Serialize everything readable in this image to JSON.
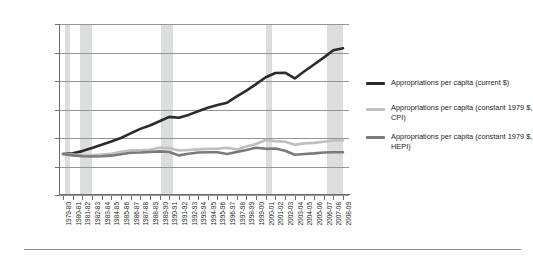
{
  "chart_data": {
    "type": "line",
    "title": "",
    "subtitle": "",
    "xlabel": "",
    "ylabel": "",
    "ylim": [
      0,
      60
    ],
    "ytick_labels": [
      "$0.00",
      "$10.00",
      "$20.00",
      "$30.00",
      "$40.00",
      "$50.00",
      "$60.00"
    ],
    "ytick_values": [
      0,
      10,
      20,
      30,
      40,
      50,
      60
    ],
    "grid": "horizontal",
    "legend_position": "right",
    "categories": [
      "1979-80",
      "1980-81",
      "1981-82",
      "1982-83",
      "1984-85",
      "1984-85",
      "1985-86",
      "1986-87",
      "1987-88",
      "1988-89",
      "1989-90",
      "1990-91",
      "1991-92",
      "1992-93",
      "1993-94",
      "1994-95",
      "1995-96",
      "1996-97",
      "1997-98",
      "1998-99",
      "1999-00",
      "2000-01",
      "2001-02",
      "2002-03",
      "2003-04",
      "2004-05",
      "2005-06",
      "2006-07",
      "2007-08",
      "2008-09"
    ],
    "x_tick_labels": [
      "1979-80",
      "1980-81",
      "1981-82",
      "1982-83",
      "1983-84",
      "1984-85",
      "1985-86",
      "1986-87",
      "1987-88",
      "1988-89",
      "1989-90",
      "1990-91",
      "1991-92",
      "1992-93",
      "1993-94",
      "1994-95",
      "1995-96",
      "1996-97",
      "1997-98",
      "1998-99",
      "1999-00",
      "2000-01",
      "2001-02",
      "2002-03",
      "2003-04",
      "2004-05",
      "2005-06",
      "2006-07",
      "2007-08",
      "2008-09"
    ],
    "series": [
      {
        "name": "Appropriations per capita (current $)",
        "color": "#2b2b2b",
        "width": 2.6,
        "values": [
          14.4,
          14.6,
          15.4,
          16.5,
          17.6,
          18.8,
          20.0,
          21.6,
          23.2,
          24.4,
          25.9,
          27.4,
          27.1,
          28.1,
          29.4,
          30.6,
          31.6,
          32.4,
          34.6,
          36.6,
          38.9,
          41.3,
          42.8,
          42.9,
          40.9,
          43.4,
          45.8,
          48.2,
          50.8,
          51.5
        ]
      },
      {
        "name": "Appropriations per capita (constant 1979 $, CPI)",
        "color": "#bfbfbf",
        "width": 2.6,
        "values": [
          14.4,
          14.2,
          14.0,
          13.9,
          14.2,
          14.5,
          15.2,
          15.7,
          15.7,
          15.9,
          16.6,
          16.5,
          15.6,
          15.8,
          16.0,
          16.2,
          16.2,
          16.6,
          16.0,
          17.0,
          17.9,
          19.3,
          18.9,
          18.7,
          17.6,
          18.1,
          18.3,
          18.7,
          19.1,
          19.1
        ]
      },
      {
        "name": "Appropriations per capita (constant 1979 $, HEPI)",
        "color": "#7a7a7a",
        "width": 2.6,
        "values": [
          14.4,
          13.9,
          13.6,
          13.5,
          13.6,
          13.8,
          14.3,
          14.8,
          14.9,
          15.1,
          15.3,
          15.1,
          13.9,
          14.5,
          14.9,
          15.0,
          15.0,
          14.4,
          15.1,
          15.8,
          16.6,
          16.2,
          16.3,
          15.5,
          14.1,
          14.4,
          14.6,
          14.9,
          15.0,
          15.0
        ]
      }
    ],
    "shaded_bands": [
      {
        "label": "recession",
        "start_index": 0.25,
        "end_index": 0.75,
        "color": "#d6d7d9"
      },
      {
        "label": "recession",
        "start_index": 1.75,
        "end_index": 3.0,
        "color": "#d6d7d9"
      },
      {
        "label": "recession",
        "start_index": 10.2,
        "end_index": 11.4,
        "color": "#d6d7d9"
      },
      {
        "label": "recession",
        "start_index": 21.0,
        "end_index": 21.6,
        "color": "#d6d7d9"
      },
      {
        "label": "recession",
        "start_index": 27.3,
        "end_index": 29.0,
        "color": "#d6d7d9"
      }
    ]
  },
  "legend": {
    "entries": [
      {
        "label": "Appropriations per capita (current $)",
        "color": "#2b2b2b"
      },
      {
        "label": "Appropriations per capita (constant 1979 $, CPI)",
        "color": "#bfbfbf"
      },
      {
        "label": "Appropriations per capita (constant 1979 $, HEPI)",
        "color": "#7a7a7a"
      }
    ]
  }
}
